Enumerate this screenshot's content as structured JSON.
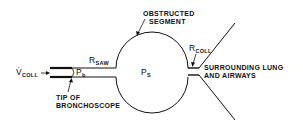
{
  "diagram": {
    "labels": {
      "obstructed_segment_line1": "OBSTRUCTED",
      "obstructed_segment_line2": "SEGMENT",
      "r_saw_main": "R",
      "r_saw_sub": "SAW",
      "r_coll_main": "R",
      "r_coll_sub": "COLL",
      "v_coll_main": "V̇",
      "v_coll_sub": "COLL",
      "p_b_main": "P",
      "p_b_sub": "b",
      "p_s_main": "P",
      "p_s_sub": "S",
      "tip_line1": "TIP OF",
      "tip_line2": "BRONCHOSCOPE",
      "surrounding_line1": "SURROUNDING LUNG",
      "surrounding_line2": "AND AIRWAYS"
    },
    "colors": {
      "stroke": "#111111",
      "background": "#ffffff"
    }
  }
}
